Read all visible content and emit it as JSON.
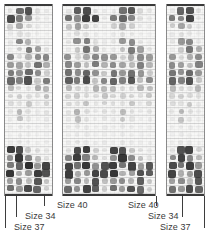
{
  "figure": {
    "background_color": "#ffffff",
    "ink_color": "#3a3a3a",
    "spot_color": "#111111"
  },
  "panels": [
    {
      "id": "panel-left",
      "name": "left-membrane-panel",
      "x": 4,
      "y": 4,
      "width": 49,
      "height": 192,
      "columns": 5,
      "rows": 24
    },
    {
      "id": "panel-center",
      "name": "center-membrane-panel",
      "x": 62,
      "y": 4,
      "width": 94,
      "height": 192,
      "columns": 10,
      "rows": 24
    },
    {
      "id": "panel-right",
      "name": "right-membrane-panel",
      "x": 166,
      "y": 4,
      "width": 39,
      "height": 192,
      "columns": 4,
      "rows": 24
    }
  ],
  "annotations": {
    "labels": [
      {
        "id": "label-size-40-left",
        "text": "Size 40",
        "x": 57,
        "y": 200,
        "align": "left"
      },
      {
        "id": "label-size-40-right",
        "text": "Size 40",
        "x": 128,
        "y": 200,
        "align": "left"
      },
      {
        "id": "label-size-34-left",
        "text": "Size 34",
        "x": 25,
        "y": 211,
        "align": "left"
      },
      {
        "id": "label-size-37-left",
        "text": "Size 37",
        "x": 14,
        "y": 222,
        "align": "left"
      },
      {
        "id": "label-size-34-right",
        "text": "Size 34",
        "x": 148,
        "y": 211,
        "align": "left"
      },
      {
        "id": "label-size-37-right",
        "text": "Size 37",
        "x": 160,
        "y": 222,
        "align": "left"
      }
    ],
    "leaders": [
      {
        "id": "leader-size-37-left",
        "x": 5,
        "y": 196,
        "length": 32
      },
      {
        "id": "leader-size-34-left",
        "x": 16,
        "y": 196,
        "length": 21
      },
      {
        "id": "leader-size-40-left",
        "x": 44,
        "y": 196,
        "length": 10
      },
      {
        "id": "leader-size-40-right",
        "x": 156,
        "y": 196,
        "length": 10
      },
      {
        "id": "leader-size-34-right",
        "x": 182,
        "y": 196,
        "length": 21
      },
      {
        "id": "leader-size-37-right",
        "x": 204,
        "y": 196,
        "length": 32
      }
    ]
  },
  "chart_data": {
    "type": "heatmap",
    "xlabel": "",
    "ylabel": "",
    "value_range": [
      0,
      1
    ],
    "colormap": "grayscale-inverted",
    "legend": false,
    "grid": true,
    "annotation_labels": [
      "Size 40",
      "Size 34",
      "Size 37"
    ],
    "panels": [
      {
        "name": "left-membrane-panel",
        "columns": 5,
        "rows": 24,
        "intensities": [
          [
            0.18,
            0.72,
            0.8,
            0.2,
            0.14
          ],
          [
            0.82,
            0.66,
            0.58,
            0.16,
            0.1
          ],
          [
            0.3,
            0.48,
            0.26,
            0.12,
            0.08
          ],
          [
            0.12,
            0.2,
            0.16,
            0.1,
            0.08
          ],
          [
            0.16,
            0.62,
            0.44,
            0.14,
            0.1
          ],
          [
            0.1,
            0.3,
            0.66,
            0.52,
            0.18
          ],
          [
            0.62,
            0.22,
            0.44,
            0.6,
            0.62
          ],
          [
            0.54,
            0.5,
            0.36,
            0.7,
            0.46
          ],
          [
            0.66,
            0.58,
            0.72,
            0.6,
            0.3
          ],
          [
            0.72,
            0.64,
            0.8,
            0.34,
            0.66
          ],
          [
            0.4,
            0.24,
            0.18,
            0.46,
            0.42
          ],
          [
            0.26,
            0.3,
            0.22,
            0.2,
            0.38
          ],
          [
            0.22,
            0.18,
            0.34,
            0.14,
            0.26
          ],
          [
            0.16,
            0.42,
            0.2,
            0.12,
            0.18
          ],
          [
            0.12,
            0.36,
            0.16,
            0.1,
            0.14
          ],
          [
            0.1,
            0.14,
            0.12,
            0.08,
            0.1
          ],
          [
            0.08,
            0.12,
            0.1,
            0.08,
            0.08
          ],
          [
            0.1,
            0.16,
            0.12,
            0.1,
            0.12
          ],
          [
            0.86,
            0.82,
            0.34,
            0.22,
            0.16
          ],
          [
            0.58,
            0.88,
            0.62,
            0.4,
            0.2
          ],
          [
            0.66,
            0.74,
            0.9,
            0.56,
            0.84
          ],
          [
            0.88,
            0.46,
            0.54,
            0.86,
            0.8
          ],
          [
            0.52,
            0.6,
            0.4,
            0.78,
            0.36
          ],
          [
            0.7,
            0.56,
            0.82,
            0.74,
            0.3
          ]
        ]
      },
      {
        "name": "center-membrane-panel",
        "columns": 10,
        "rows": 24,
        "intensities": [
          [
            0.16,
            0.76,
            0.82,
            0.22,
            0.12,
            0.14,
            0.7,
            0.78,
            0.24,
            0.16
          ],
          [
            0.7,
            0.6,
            0.86,
            0.84,
            0.14,
            0.66,
            0.74,
            0.62,
            0.2,
            0.12
          ],
          [
            0.36,
            0.52,
            0.34,
            0.18,
            0.1,
            0.3,
            0.48,
            0.3,
            0.14,
            0.1
          ],
          [
            0.14,
            0.22,
            0.18,
            0.12,
            0.08,
            0.12,
            0.2,
            0.16,
            0.1,
            0.08
          ],
          [
            0.18,
            0.58,
            0.64,
            0.2,
            0.12,
            0.16,
            0.56,
            0.6,
            0.18,
            0.1
          ],
          [
            0.12,
            0.34,
            0.7,
            0.48,
            0.16,
            0.14,
            0.36,
            0.66,
            0.52,
            0.18
          ],
          [
            0.58,
            0.26,
            0.48,
            0.62,
            0.58,
            0.56,
            0.28,
            0.46,
            0.6,
            0.54
          ],
          [
            0.62,
            0.54,
            0.38,
            0.66,
            0.44,
            0.6,
            0.5,
            0.4,
            0.64,
            0.42
          ],
          [
            0.7,
            0.6,
            0.74,
            0.58,
            0.34,
            0.68,
            0.56,
            0.7,
            0.56,
            0.32
          ],
          [
            0.76,
            0.66,
            0.82,
            0.36,
            0.62,
            0.74,
            0.64,
            0.78,
            0.38,
            0.6
          ],
          [
            0.42,
            0.26,
            0.2,
            0.44,
            0.4,
            0.4,
            0.24,
            0.22,
            0.42,
            0.38
          ],
          [
            0.28,
            0.32,
            0.24,
            0.22,
            0.36,
            0.26,
            0.3,
            0.26,
            0.2,
            0.34
          ],
          [
            0.24,
            0.2,
            0.36,
            0.16,
            0.28,
            0.22,
            0.18,
            0.34,
            0.14,
            0.26
          ],
          [
            0.18,
            0.44,
            0.22,
            0.14,
            0.2,
            0.16,
            0.4,
            0.2,
            0.12,
            0.18
          ],
          [
            0.14,
            0.38,
            0.18,
            0.12,
            0.16,
            0.12,
            0.34,
            0.16,
            0.1,
            0.14
          ],
          [
            0.12,
            0.16,
            0.14,
            0.1,
            0.12,
            0.1,
            0.14,
            0.12,
            0.08,
            0.1
          ],
          [
            0.1,
            0.14,
            0.12,
            0.08,
            0.1,
            0.08,
            0.12,
            0.1,
            0.08,
            0.08
          ],
          [
            0.12,
            0.18,
            0.14,
            0.12,
            0.14,
            0.1,
            0.16,
            0.12,
            0.1,
            0.12
          ],
          [
            0.2,
            0.82,
            0.86,
            0.3,
            0.18,
            0.84,
            0.8,
            0.34,
            0.2,
            0.14
          ],
          [
            0.62,
            0.86,
            0.64,
            0.42,
            0.22,
            0.58,
            0.88,
            0.6,
            0.38,
            0.18
          ],
          [
            0.84,
            0.7,
            0.88,
            0.58,
            0.8,
            0.86,
            0.68,
            0.84,
            0.54,
            0.78
          ],
          [
            0.86,
            0.48,
            0.56,
            0.84,
            0.82,
            0.88,
            0.44,
            0.52,
            0.8,
            0.76
          ],
          [
            0.54,
            0.62,
            0.42,
            0.8,
            0.38,
            0.56,
            0.6,
            0.44,
            0.76,
            0.34
          ],
          [
            0.72,
            0.58,
            0.84,
            0.76,
            0.32,
            0.7,
            0.54,
            0.8,
            0.72,
            0.3
          ]
        ]
      },
      {
        "name": "right-membrane-panel",
        "columns": 4,
        "rows": 24,
        "intensities": [
          [
            0.14,
            0.74,
            0.8,
            0.2
          ],
          [
            0.66,
            0.62,
            0.84,
            0.16
          ],
          [
            0.32,
            0.5,
            0.32,
            0.12
          ],
          [
            0.12,
            0.2,
            0.16,
            0.1
          ],
          [
            0.16,
            0.56,
            0.62,
            0.14
          ],
          [
            0.1,
            0.32,
            0.68,
            0.46
          ],
          [
            0.56,
            0.24,
            0.46,
            0.6
          ],
          [
            0.6,
            0.52,
            0.38,
            0.64
          ],
          [
            0.68,
            0.58,
            0.72,
            0.56
          ],
          [
            0.74,
            0.64,
            0.8,
            0.34
          ],
          [
            0.4,
            0.24,
            0.2,
            0.42
          ],
          [
            0.26,
            0.3,
            0.24,
            0.2
          ],
          [
            0.22,
            0.18,
            0.34,
            0.14
          ],
          [
            0.16,
            0.42,
            0.2,
            0.12
          ],
          [
            0.12,
            0.36,
            0.16,
            0.1
          ],
          [
            0.1,
            0.14,
            0.12,
            0.08
          ],
          [
            0.08,
            0.12,
            0.1,
            0.08
          ],
          [
            0.1,
            0.16,
            0.12,
            0.1
          ],
          [
            0.18,
            0.8,
            0.84,
            0.28
          ],
          [
            0.6,
            0.84,
            0.62,
            0.4
          ],
          [
            0.82,
            0.68,
            0.86,
            0.56
          ],
          [
            0.84,
            0.46,
            0.54,
            0.82
          ],
          [
            0.52,
            0.6,
            0.4,
            0.78
          ],
          [
            0.7,
            0.56,
            0.82,
            0.74
          ]
        ]
      }
    ]
  }
}
